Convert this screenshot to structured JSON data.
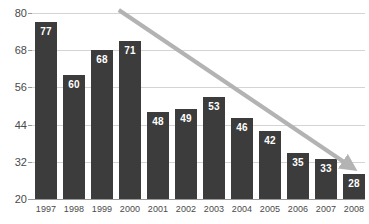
{
  "chart_data": {
    "type": "bar",
    "title": "",
    "xlabel": "",
    "ylabel": "",
    "categories": [
      "1997",
      "1998",
      "1999",
      "2000",
      "2001",
      "2002",
      "2003",
      "2004",
      "2005",
      "2006",
      "2007",
      "2008"
    ],
    "values": [
      77,
      60,
      68,
      71,
      48,
      49,
      53,
      46,
      42,
      35,
      33,
      28
    ],
    "data_labels": [
      "77",
      "60",
      "68",
      "71",
      "48",
      "49",
      "53",
      "46",
      "42",
      "35",
      "33",
      "28"
    ],
    "ylim": [
      20,
      80
    ],
    "yticks": [
      20,
      32,
      44,
      56,
      68,
      80
    ],
    "ytick_labels": [
      "20",
      "32",
      "44",
      "56",
      "68",
      "80"
    ],
    "grid": "horizontal",
    "legend": "none",
    "annotations": [
      {
        "name": "downward-trend-arrow",
        "kind": "arrow",
        "from_x": 1999.6,
        "from_y": 81,
        "to_x": 2007.8,
        "to_y": 31
      }
    ],
    "colors": {
      "bar": "#3c3c3c",
      "data_label": "#ffffff",
      "gridline": "#d4d4d4",
      "axis": "#9a9a9a",
      "tick_text": "#4a4a4a",
      "trend_arrow": "#b3b3b3",
      "background": "#ffffff"
    }
  }
}
